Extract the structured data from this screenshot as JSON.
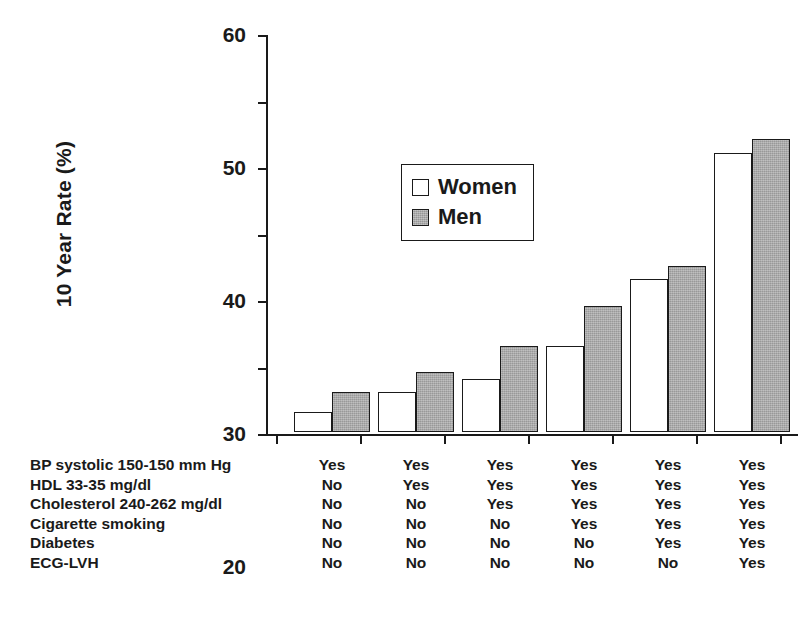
{
  "chart_data": {
    "type": "bar",
    "title": "",
    "xlabel": "",
    "ylabel": "10 Year Rate (%)",
    "ylim": [
      0,
      60
    ],
    "yticks": [
      0,
      10,
      20,
      30,
      40,
      50,
      60
    ],
    "grid": false,
    "legend_position": "upper-left-inside",
    "categories": [
      "1",
      "2",
      "3",
      "4",
      "5",
      "6"
    ],
    "series": [
      {
        "name": "Women",
        "values": [
          3,
          6,
          8,
          13,
          23,
          42
        ],
        "color": "#ffffff"
      },
      {
        "name": "Men",
        "values": [
          6,
          9,
          13,
          19,
          25,
          44
        ],
        "color": "#a9a9a9"
      }
    ],
    "risk_factor_table": {
      "rows": [
        {
          "label": "BP systolic 150-150 mm Hg",
          "values": [
            "Yes",
            "Yes",
            "Yes",
            "Yes",
            "Yes",
            "Yes"
          ]
        },
        {
          "label": "HDL 33-35 mg/dl",
          "values": [
            "No",
            "Yes",
            "Yes",
            "Yes",
            "Yes",
            "Yes"
          ]
        },
        {
          "label": "Cholesterol 240-262 mg/dl",
          "values": [
            "No",
            "No",
            "Yes",
            "Yes",
            "Yes",
            "Yes"
          ]
        },
        {
          "label": "Cigarette smoking",
          "values": [
            "No",
            "No",
            "No",
            "Yes",
            "Yes",
            "Yes"
          ]
        },
        {
          "label": "Diabetes",
          "values": [
            "No",
            "No",
            "No",
            "No",
            "Yes",
            "Yes"
          ]
        },
        {
          "label": "ECG-LVH",
          "values": [
            "No",
            "No",
            "No",
            "No",
            "No",
            "Yes"
          ]
        }
      ]
    }
  },
  "legend": {
    "items": [
      {
        "label": "Women"
      },
      {
        "label": "Men"
      }
    ]
  },
  "axis": {
    "y_title": "10 Year Rate (%)"
  }
}
